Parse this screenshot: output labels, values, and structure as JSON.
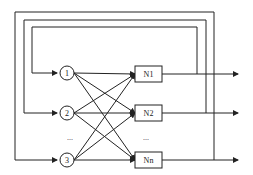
{
  "diagram": {
    "type": "recurrent-network",
    "input_nodes": [
      {
        "id": "in1",
        "label": "1",
        "cx": 67,
        "cy": 73
      },
      {
        "id": "in2",
        "label": "2",
        "cx": 67,
        "cy": 113
      },
      {
        "id": "in3",
        "label": "3",
        "cx": 67,
        "cy": 160
      }
    ],
    "input_ellipsis": "...",
    "output_nodes": [
      {
        "id": "n1",
        "label": "N1",
        "y": 74
      },
      {
        "id": "n2",
        "label": "N2",
        "y": 113
      },
      {
        "id": "nn",
        "label": "Nn",
        "y": 160
      }
    ],
    "output_ellipsis": "...",
    "feedback_loops": [
      {
        "from": "N1",
        "to": "1"
      },
      {
        "from": "N2",
        "to": "2"
      },
      {
        "from": "Nn",
        "to": "3"
      }
    ],
    "colors": {
      "line": "#222222",
      "background": "#ffffff"
    }
  }
}
